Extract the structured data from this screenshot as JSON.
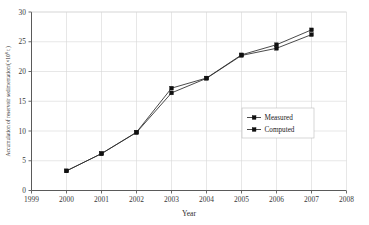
{
  "chart_data": {
    "type": "line",
    "title": "",
    "xlabel": "Year",
    "ylabel": "Accumulation of reservoir sedimentation/(×10⁸ t )",
    "ylabel_parts": {
      "main": "Accumulation of reservoir sedimentation/(×10",
      "exponent": "8",
      "tail": " t )"
    },
    "x": [
      2000,
      2001,
      2002,
      2003,
      2004,
      2005,
      2006,
      2007
    ],
    "categories": [
      "2000",
      "2001",
      "2002",
      "2003",
      "2004",
      "2005",
      "2006",
      "2007"
    ],
    "xlim": [
      1999,
      2008
    ],
    "ylim": [
      0,
      30
    ],
    "xticks": [
      "1999",
      "2000",
      "2001",
      "2002",
      "2003",
      "2004",
      "2005",
      "2006",
      "2007",
      "2008"
    ],
    "xtick_values": [
      1999,
      2000,
      2001,
      2002,
      2003,
      2004,
      2005,
      2006,
      2007,
      2008
    ],
    "yticks": [
      "0",
      "5",
      "10",
      "15",
      "20",
      "25",
      "30"
    ],
    "ytick_values": [
      0,
      5,
      10,
      15,
      20,
      25,
      30
    ],
    "grid": true,
    "grid_axis": "both",
    "legend_position": "center-right",
    "series": [
      {
        "name": "Measured",
        "marker": "square",
        "color": "#101010",
        "values": [
          3.3,
          6.2,
          9.75,
          16.4,
          18.85,
          22.7,
          23.9,
          26.2
        ]
      },
      {
        "name": "Computed",
        "marker": "square",
        "color": "#101010",
        "values": [
          3.3,
          6.2,
          9.8,
          17.2,
          18.9,
          22.8,
          24.5,
          27.0
        ]
      }
    ]
  },
  "legend": {
    "items": [
      {
        "label": "Measured"
      },
      {
        "label": "Computed"
      }
    ]
  },
  "colors": {
    "line": "#2a2a2a",
    "marker": "#101010",
    "grid": "#d6d6d6",
    "axis": "#5a5a5a",
    "background": "#ffffff"
  }
}
